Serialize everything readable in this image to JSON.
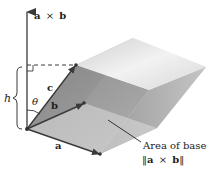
{
  "figure": {
    "type": "parallelepiped-volume-diagram",
    "labels": {
      "cross_product": [
        "a",
        "×",
        "b"
      ],
      "vector_a": "a",
      "vector_b": "b",
      "vector_c": "c",
      "height": "h",
      "angle": "θ",
      "area_line1": "Area of base",
      "area_line2": [
        "‖",
        "a",
        "×",
        "b",
        "‖"
      ]
    },
    "colors": {
      "arrow": "#3a3a3a",
      "top_face": "#e6e6e6",
      "front_face": "#8c8c8c",
      "right_face": "#a9a9a9",
      "base_face": "#cfcfcf"
    }
  }
}
